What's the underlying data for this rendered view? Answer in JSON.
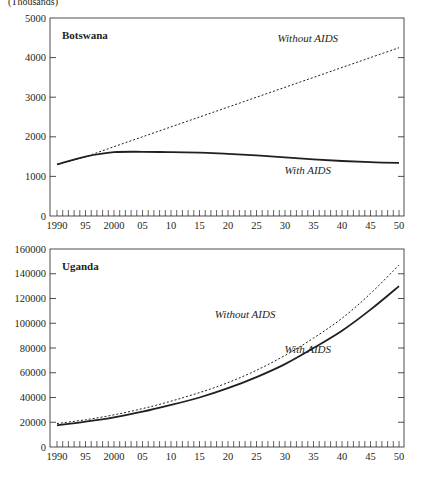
{
  "unit_label": "(Thousands)",
  "chart_data": [
    {
      "type": "line",
      "title": "Botswana",
      "xlabel": "",
      "ylabel": "(Thousands)",
      "xlim": [
        1990,
        2050
      ],
      "ylim": [
        0,
        5000
      ],
      "grid": false,
      "yticks": [
        0,
        1000,
        2000,
        3000,
        4000,
        5000
      ],
      "xtick_labels": [
        "1990",
        "95",
        "2000",
        "05",
        "10",
        "15",
        "20",
        "25",
        "30",
        "35",
        "40",
        "45",
        "50"
      ],
      "x": [
        1990,
        1995,
        2000,
        2005,
        2010,
        2015,
        2020,
        2025,
        2030,
        2035,
        2040,
        2045,
        2050
      ],
      "series": [
        {
          "name": "Without AIDS",
          "style": "dotted",
          "values": [
            1300,
            1500,
            1750,
            2000,
            2250,
            2500,
            2750,
            3000,
            3250,
            3500,
            3750,
            4000,
            4250
          ]
        },
        {
          "name": "With AIDS",
          "style": "solid",
          "values": [
            1300,
            1500,
            1610,
            1620,
            1610,
            1600,
            1570,
            1530,
            1480,
            1430,
            1390,
            1360,
            1340
          ]
        }
      ],
      "annotations": [
        {
          "text": "Without AIDS",
          "x": 2034,
          "y": 4400
        },
        {
          "text": "With AIDS",
          "x": 2034,
          "y": 1050
        }
      ]
    },
    {
      "type": "line",
      "title": "Uganda",
      "xlabel": "",
      "ylabel": "(Thousands)",
      "xlim": [
        1990,
        2050
      ],
      "ylim": [
        0,
        160000
      ],
      "grid": false,
      "yticks": [
        0,
        20000,
        40000,
        60000,
        80000,
        100000,
        120000,
        140000,
        160000
      ],
      "xtick_labels": [
        "1990",
        "95",
        "2000",
        "05",
        "10",
        "15",
        "20",
        "25",
        "30",
        "35",
        "40",
        "45",
        "50"
      ],
      "x": [
        1990,
        1995,
        2000,
        2005,
        2010,
        2015,
        2020,
        2025,
        2030,
        2035,
        2040,
        2045,
        2050
      ],
      "series": [
        {
          "name": "Without AIDS",
          "style": "dotted",
          "values": [
            19000,
            22000,
            26000,
            31000,
            37000,
            44000,
            52000,
            62000,
            74000,
            88000,
            104000,
            124000,
            147000
          ]
        },
        {
          "name": "With AIDS",
          "style": "solid",
          "values": [
            17500,
            20500,
            24000,
            28500,
            34000,
            40000,
            47500,
            56500,
            67000,
            80000,
            94000,
            111000,
            130000
          ]
        }
      ],
      "annotations": [
        {
          "text": "Without AIDS",
          "x": 2023,
          "y": 104000
        },
        {
          "text": "With AIDS",
          "x": 2034,
          "y": 76000
        }
      ]
    }
  ]
}
